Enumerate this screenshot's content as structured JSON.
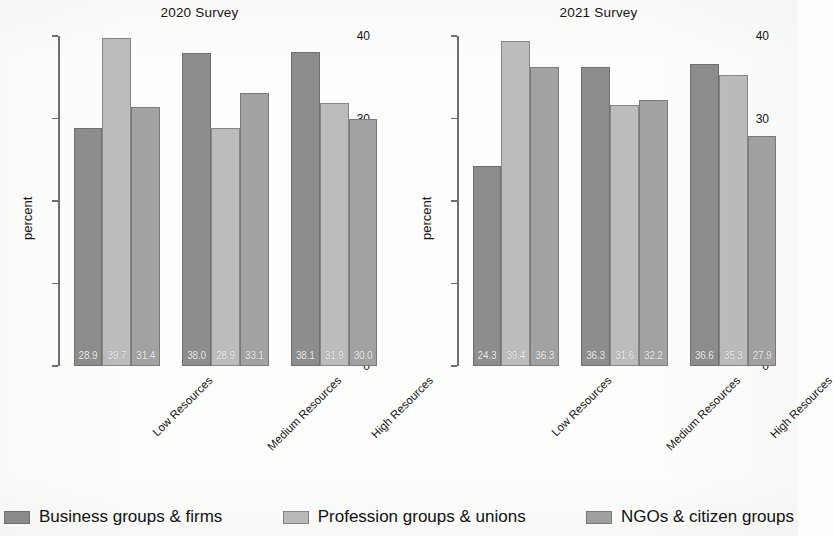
{
  "chart_data": {
    "type": "bar",
    "panels": [
      {
        "title": "2020 Survey",
        "ylabel": "percent",
        "xlabel": "",
        "ylim": [
          0,
          40
        ],
        "yticks": [
          0,
          10,
          20,
          30,
          40
        ],
        "ytick_labels": [
          "0",
          "10",
          "20",
          "30",
          "40"
        ],
        "categories": [
          "Low Resources",
          "Medium Resources",
          "High Resources"
        ],
        "series": [
          {
            "name": "Business groups & firms",
            "values": [
              28.9,
              38.0,
              38.1
            ],
            "labels": [
              "28.9",
              "38.0",
              "38.1"
            ]
          },
          {
            "name": "Profession groups & unions",
            "values": [
              39.7,
              28.9,
              31.9
            ],
            "labels": [
              "39.7",
              "28.9",
              "31.9"
            ]
          },
          {
            "name": "NGOs & citizen groups",
            "values": [
              31.4,
              33.1,
              30.0
            ],
            "labels": [
              "31.4",
              "33.1",
              "30.0"
            ]
          }
        ]
      },
      {
        "title": "2021 Survey",
        "ylabel": "percent",
        "xlabel": "",
        "ylim": [
          0,
          40
        ],
        "yticks": [
          0,
          10,
          20,
          30,
          40
        ],
        "ytick_labels": [
          "0",
          "10",
          "20",
          "30",
          "40"
        ],
        "categories": [
          "Low Resources",
          "Medium Resources",
          "High Resources"
        ],
        "series": [
          {
            "name": "Business groups & firms",
            "values": [
              24.3,
              36.3,
              36.6
            ],
            "labels": [
              "24.3",
              "36.3",
              "36.6"
            ]
          },
          {
            "name": "Profession groups & unions",
            "values": [
              39.4,
              31.6,
              35.3
            ],
            "labels": [
              "39.4",
              "31.6",
              "35.3"
            ]
          },
          {
            "name": "NGOs & citizen groups",
            "values": [
              36.3,
              32.2,
              27.9
            ],
            "labels": [
              "36.3",
              "32.2",
              "27.9"
            ]
          }
        ]
      }
    ],
    "legend": {
      "position": "bottom",
      "entries": [
        {
          "label": "Business groups & firms",
          "color": "#8d8d8d"
        },
        {
          "label": "Profession groups & unions",
          "color": "#bcbcbc"
        },
        {
          "label": "NGOs & citizen groups",
          "color": "#a2a2a2"
        }
      ]
    },
    "grid": false,
    "value_labels_inside_bars": true,
    "colors": [
      "#8d8d8d",
      "#bcbcbc",
      "#a2a2a2"
    ],
    "background": "#fdfdfc",
    "axis_color": "#6f6f6f"
  }
}
